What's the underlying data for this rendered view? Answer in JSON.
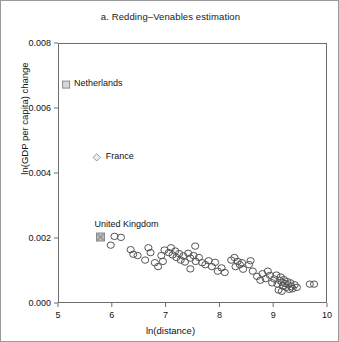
{
  "chart_data": {
    "type": "scatter",
    "title": "a. Redding–Venables estimation",
    "xlabel": "ln(distance)",
    "ylabel": "ln(GDP per capita) change",
    "xlim": [
      5,
      10
    ],
    "ylim": [
      0.0,
      0.008
    ],
    "xticks": [
      "5",
      "6",
      "7",
      "8",
      "9",
      "10"
    ],
    "xtick_values": [
      5,
      6,
      7,
      8,
      9,
      10
    ],
    "yticks": [
      "0.000",
      "0.002",
      "0.004",
      "0.006",
      "0.008"
    ],
    "ytick_values": [
      0.0,
      0.002,
      0.004,
      0.006,
      0.008
    ],
    "grid": false,
    "legend": null,
    "series": [
      {
        "name": "highlighted-countries",
        "marker": "square",
        "color": "#8c8c8c",
        "points": [
          {
            "label": "Netherlands",
            "x": 5.15,
            "y": 0.00672,
            "marker": "square-open",
            "label_dx": 8,
            "label_dy": -7
          },
          {
            "label": "France",
            "x": 5.72,
            "y": 0.00448,
            "marker": "diamond-open",
            "label_dx": 9,
            "label_dy": -6
          },
          {
            "label": "United Kingdom",
            "x": 5.79,
            "y": 0.00203,
            "marker": "square-filled",
            "label_dx": -6,
            "label_dy": -18
          }
        ]
      },
      {
        "name": "countries",
        "marker": "circle-open",
        "color": "#555555",
        "values": [
          [
            6.05,
            0.00205
          ],
          [
            6.17,
            0.00202
          ],
          [
            5.98,
            0.00178
          ],
          [
            6.35,
            0.00164
          ],
          [
            6.4,
            0.0015
          ],
          [
            6.48,
            0.00146
          ],
          [
            6.68,
            0.0017
          ],
          [
            6.72,
            0.00155
          ],
          [
            6.62,
            0.00132
          ],
          [
            6.8,
            0.00124
          ],
          [
            6.92,
            0.00146
          ],
          [
            6.98,
            0.00163
          ],
          [
            6.95,
            0.00128
          ],
          [
            6.86,
            0.00112
          ],
          [
            7.06,
            0.00155
          ],
          [
            7.1,
            0.0017
          ],
          [
            7.13,
            0.00148
          ],
          [
            7.18,
            0.0016
          ],
          [
            7.2,
            0.0014
          ],
          [
            7.25,
            0.00152
          ],
          [
            7.28,
            0.00132
          ],
          [
            7.33,
            0.00145
          ],
          [
            7.36,
            0.00126
          ],
          [
            7.42,
            0.00153
          ],
          [
            7.46,
            0.00138
          ],
          [
            7.52,
            0.00146
          ],
          [
            7.56,
            0.00128
          ],
          [
            7.62,
            0.0014
          ],
          [
            7.68,
            0.00124
          ],
          [
            7.74,
            0.00118
          ],
          [
            7.8,
            0.0013
          ],
          [
            7.86,
            0.00112
          ],
          [
            7.92,
            0.00125
          ],
          [
            7.55,
            0.00175
          ],
          [
            7.46,
            0.00105
          ],
          [
            7.97,
            0.00098
          ],
          [
            8.04,
            0.00108
          ],
          [
            8.1,
            0.00094
          ],
          [
            8.22,
            0.00132
          ],
          [
            8.28,
            0.0014
          ],
          [
            8.34,
            0.00128
          ],
          [
            8.3,
            0.00112
          ],
          [
            8.38,
            0.00118
          ],
          [
            8.44,
            0.00104
          ],
          [
            8.42,
            0.00124
          ],
          [
            8.55,
            0.00118
          ],
          [
            8.58,
            0.0013
          ],
          [
            8.62,
            0.00098
          ],
          [
            8.7,
            0.00082
          ],
          [
            8.76,
            0.0007
          ],
          [
            8.8,
            0.0009
          ],
          [
            8.86,
            0.00075
          ],
          [
            8.9,
            0.00098
          ],
          [
            8.94,
            0.00085
          ],
          [
            8.98,
            0.00062
          ],
          [
            9.02,
            0.00074
          ],
          [
            9.06,
            0.00086
          ],
          [
            9.08,
            0.00058
          ],
          [
            9.12,
            0.0007
          ],
          [
            9.14,
            0.0008
          ],
          [
            9.16,
            0.00064
          ],
          [
            9.18,
            0.00052
          ],
          [
            9.2,
            0.00072
          ],
          [
            9.22,
            0.0006
          ],
          [
            9.24,
            0.00048
          ],
          [
            9.26,
            0.00066
          ],
          [
            9.28,
            0.00056
          ],
          [
            9.3,
            0.00042
          ],
          [
            9.32,
            0.00062
          ],
          [
            9.34,
            0.0005
          ],
          [
            9.1,
            0.0004
          ],
          [
            9.16,
            0.00036
          ],
          [
            9.36,
            0.00044
          ],
          [
            9.4,
            0.00056
          ],
          [
            9.44,
            0.00048
          ],
          [
            9.68,
            0.00058
          ],
          [
            9.76,
            0.00058
          ]
        ]
      }
    ]
  }
}
